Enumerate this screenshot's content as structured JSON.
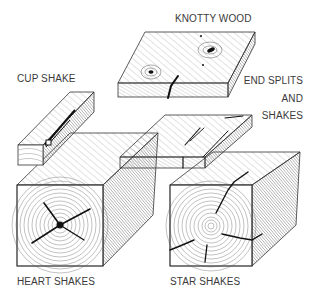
{
  "figure": {
    "colors": {
      "ink": "#2a2a2a",
      "label": "#3a3a3a",
      "background": "#ffffff"
    },
    "labels": {
      "knotty_wood": "KNOTTY WOOD",
      "cup_shake": "CUP SHAKE",
      "end_splits_1": "END SPLITS",
      "end_splits_2": "AND",
      "end_splits_3": "SHAKES",
      "heart_shakes": "HEART SHAKES",
      "star_shakes": "STAR SHAKES"
    }
  }
}
